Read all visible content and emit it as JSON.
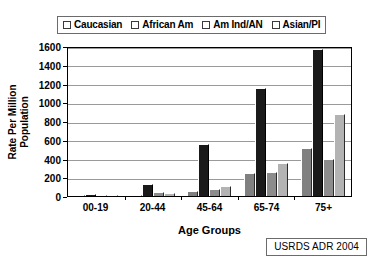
{
  "chart_data": {
    "type": "bar",
    "title": "",
    "xlabel": "Age Groups",
    "ylabel": "Rate Per Million Population",
    "ylabel_line1": "Rate Per Million",
    "ylabel_line2": "Population",
    "categories": [
      "00-19",
      "20-44",
      "45-64",
      "65-74",
      "75+"
    ],
    "ylim": [
      0,
      1600
    ],
    "yticks": [
      0,
      200,
      400,
      600,
      800,
      1000,
      1200,
      1400,
      1600
    ],
    "grid": true,
    "legend_position": "top",
    "source_note": "USRDS ADR 2004",
    "series": [
      {
        "name": "Caucasian",
        "color": "#808080",
        "values": [
          10,
          15,
          50,
          250,
          510
        ]
      },
      {
        "name": "African Am",
        "color": "#1a1a1a",
        "values": [
          18,
          130,
          550,
          1150,
          1570
        ]
      },
      {
        "name": "Am Ind/AN",
        "color": "#8c8c8c",
        "values": [
          8,
          40,
          80,
          260,
          395
        ]
      },
      {
        "name": "Asian/PI",
        "color": "#b3b3b3",
        "values": [
          6,
          35,
          110,
          350,
          870
        ]
      }
    ]
  }
}
